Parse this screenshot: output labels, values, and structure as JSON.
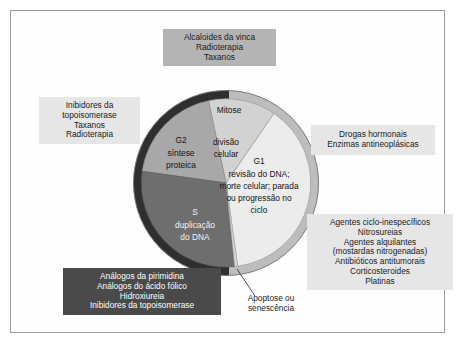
{
  "figure": {
    "frame_color": "#9d9d9d",
    "background": "#ffffff"
  },
  "wheel": {
    "type": "pie",
    "center_label": null,
    "outer_ring": {
      "dark_color": "#2f2f2f",
      "light_color": "#bdbdbd",
      "note": "anel externo escuro na metade esquerda e claro na metade direita"
    },
    "gap_label": "Apoptose ou senescência",
    "segments": [
      {
        "key": "mitose",
        "name": "Mitose",
        "sublabel": "divisão celular",
        "lines": [
          "Mitose",
          "divisão",
          "celular"
        ],
        "color": "#d2d2d2",
        "start_deg": 348,
        "end_deg": 35,
        "fraction_pct": 13
      },
      {
        "key": "g1",
        "name": "G1",
        "sublabel": "revisão do DNA; morte celular; parada ou progressão no ciclo",
        "lines": [
          "G1",
          "revisão do DNA;",
          "morte celular; parada",
          "ou progressão no",
          "ciclo"
        ],
        "color": "#ececec",
        "start_deg": 35,
        "end_deg": 172,
        "fraction_pct": 38
      },
      {
        "key": "s",
        "name": "S",
        "sublabel": "duplicação do DNA",
        "lines": [
          "S",
          "duplicação",
          "do DNA"
        ],
        "color": "#6e6e6e",
        "start_deg": 178,
        "end_deg": 270,
        "fraction_pct": 26
      },
      {
        "key": "g2",
        "name": "G2",
        "sublabel": "síntese proteica",
        "lines": [
          "G2",
          "síntese",
          "proteica"
        ],
        "color": "#a8a8a8",
        "start_deg": 270,
        "end_deg": 348,
        "fraction_pct": 23
      }
    ]
  },
  "annotations": {
    "vinca": {
      "style": "gray",
      "lines": [
        "Alcaloides da vinca",
        "Radioterapia",
        "Taxanos"
      ],
      "target": "mitose"
    },
    "topoisomerase_left": {
      "style": "light",
      "lines": [
        "Inibidores da",
        "topoisomerase",
        "Taxanos",
        "Radioterapia"
      ],
      "target": "g2"
    },
    "hormonal": {
      "style": "light",
      "lines": [
        "Drogas hormonais",
        "Enzimas antineoplásicas"
      ],
      "target": "g1"
    },
    "nonspecific": {
      "style": "light",
      "lines": [
        "Agentes ciclo-inespecíficos",
        "Nitrosureias",
        "Agentes alquilantes",
        "(mostardas nitrogenadas)",
        "Antibióticos antitumorais",
        "Corticosteroides",
        "Platinas"
      ],
      "target": "g1"
    },
    "antimetabolites": {
      "style": "dark",
      "lines": [
        "Análogos da pirimidina",
        "Análogos do ácido fólico",
        "Hidroxiureia",
        "Inibidores da topoisomerase"
      ],
      "target": "s"
    },
    "apoptose": {
      "style": "plain",
      "lines": [
        "Apoptose ou",
        "senescência"
      ],
      "target": "gap"
    }
  }
}
